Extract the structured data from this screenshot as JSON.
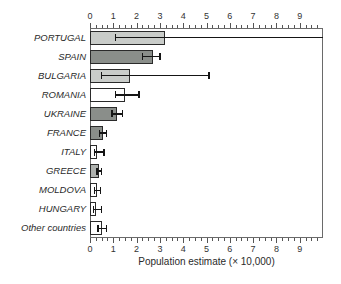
{
  "chart_data": {
    "type": "bar",
    "orientation": "horizontal",
    "title": "",
    "xlabel": "Population estimate (× 10,000)",
    "ylabel": "",
    "xlim": [
      0,
      10
    ],
    "x_ticks": [
      0,
      1,
      2,
      3,
      4,
      5,
      6,
      7,
      8,
      9
    ],
    "minor_tick_step": 0.25,
    "grid": false,
    "legend": null,
    "categories": [
      "PORTUGAL",
      "SPAIN",
      "BULGARIA",
      "ROMANIA",
      "UKRAINE",
      "FRANCE",
      "ITALY",
      "GREECE",
      "MOLDOVA",
      "HUNGARY",
      "Other countries"
    ],
    "values": [
      3.2,
      2.7,
      1.7,
      1.5,
      1.15,
      0.55,
      0.3,
      0.4,
      0.3,
      0.27,
      0.5
    ],
    "error_low": [
      1.1,
      2.25,
      0.5,
      1.1,
      0.95,
      0.4,
      0.2,
      0.3,
      0.2,
      0.15,
      0.35
    ],
    "error_high": [
      10.0,
      3.0,
      5.1,
      2.1,
      1.4,
      0.7,
      0.6,
      0.5,
      0.45,
      0.5,
      0.7
    ],
    "bar_fills": [
      "#c9ccc9",
      "#8a8e8a",
      "#c9ccc9",
      "#ffffff",
      "#8a8e8a",
      "#8a8e8a",
      "#ffffff",
      "#aeb1ae",
      "#ffffff",
      "#ffffff",
      "#ffffff"
    ],
    "colors": {
      "bar_outline": "#2a2a2a",
      "error_bar": "#151515",
      "axis": "#555555",
      "text": "#2a2a2a",
      "background": "#ffffff",
      "light_gray_fill": "#c9ccc9",
      "dark_gray_fill": "#8a8e8a",
      "medium_gray_fill": "#aeb1ae",
      "white_fill": "#ffffff"
    }
  }
}
